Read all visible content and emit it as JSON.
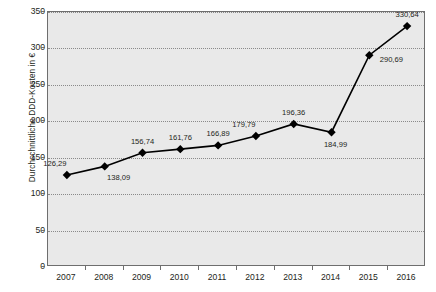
{
  "chart_data": {
    "type": "line",
    "title": "",
    "xlabel": "",
    "ylabel": "Durchschnittliche DDD-Kosten in €",
    "categories": [
      "2007",
      "2008",
      "2009",
      "2010",
      "2011",
      "2012",
      "2013",
      "2014",
      "2015",
      "2016"
    ],
    "values": [
      126.29,
      138.09,
      156.74,
      161.76,
      166.89,
      179.79,
      196.36,
      184.99,
      290.69,
      330.64
    ],
    "value_labels": [
      "126,29",
      "138,09",
      "156,74",
      "161,76",
      "166,89",
      "179,79",
      "196,36",
      "184,99",
      "290,69",
      "330,64"
    ],
    "label_positions": [
      "above-left",
      "below-right",
      "above",
      "above",
      "above",
      "above-left",
      "above",
      "below",
      "right",
      "above"
    ],
    "ylim": [
      0,
      350
    ],
    "yticks": [
      0,
      50,
      100,
      150,
      200,
      250,
      300,
      350
    ],
    "ytick_labels": [
      "0",
      "50",
      "100",
      "150",
      "200",
      "250",
      "300",
      "350"
    ],
    "grid": true,
    "grid_axis": "y",
    "legend": "none",
    "marker": "diamond",
    "series_color": "#000000",
    "plot_background": "#e9e9e9",
    "grid_color": "#8a8a8a",
    "axis_color": "#6e6e6e"
  }
}
